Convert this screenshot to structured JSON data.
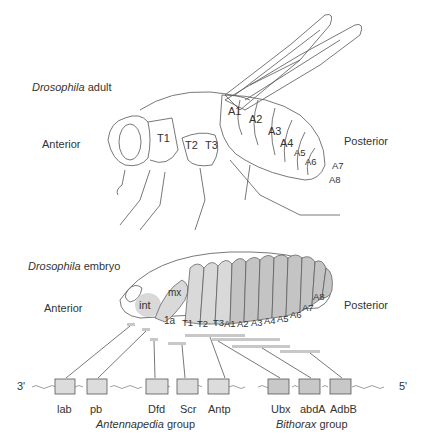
{
  "adult": {
    "title_italic": "Drosophila",
    "title_rest": " adult",
    "anterior": "Anterior",
    "posterior": "Posterior",
    "segments": [
      "T1",
      "T2",
      "T3",
      "A1",
      "A2",
      "A3",
      "A4",
      "A5",
      "A6",
      "A7",
      "A8"
    ]
  },
  "embryo": {
    "title_italic": "Drosophila",
    "title_rest": " embryo",
    "anterior": "Anterior",
    "posterior": "Posterior",
    "head_segments": [
      "int",
      "mx",
      "1a"
    ],
    "segments": [
      "T1",
      "T2",
      "T3",
      "A1",
      "A2",
      "A3",
      "A4",
      "A5",
      "A6",
      "A7",
      "A8"
    ]
  },
  "gene_cluster": {
    "end_left": "3'",
    "end_right": "5'",
    "genes": [
      "lab",
      "pb",
      "Dfd",
      "Scr",
      "Antp",
      "Ubx",
      "abdA",
      "AdbB"
    ],
    "groups": [
      {
        "italic": "Antennapedia",
        "rest": " group"
      },
      {
        "italic": "Bithorax",
        "rest": " group"
      }
    ]
  },
  "colors": {
    "light_segment": "#d9d9d9",
    "dark_segment": "#c4c4c4",
    "gene_box_light": "#dcdcdc",
    "gene_box_dark": "#c8c8c8",
    "line": "#555555"
  }
}
